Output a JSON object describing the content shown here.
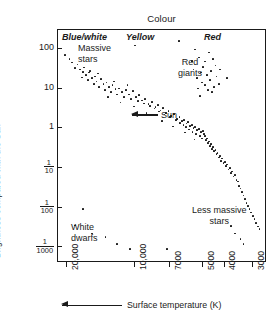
{
  "figure": {
    "top_title": "Colour",
    "y_axis_title": "Brightness compared with the Sun",
    "x_axis_title": "Surface temperature (K)"
  },
  "colour_bands": [
    {
      "name": "blue-white",
      "label": "Blue/white"
    },
    {
      "name": "yellow",
      "label": "Yellow"
    },
    {
      "name": "red",
      "label": "Red"
    }
  ],
  "y_axis": {
    "ticks": [
      {
        "label": "100",
        "fraction": null,
        "value": 100
      },
      {
        "label": "10",
        "fraction": null,
        "value": 10
      },
      {
        "label": "1",
        "fraction": null,
        "value": 1
      },
      {
        "label": "1/10",
        "fraction": {
          "num": "1",
          "den": "10"
        },
        "value": 0.1
      },
      {
        "label": "1/100",
        "fraction": {
          "num": "1",
          "den": "100"
        },
        "value": 0.01
      },
      {
        "label": "1/1000",
        "fraction": {
          "num": "1",
          "den": "1000"
        },
        "value": 0.001
      }
    ]
  },
  "x_axis": {
    "ticks": [
      {
        "label": "20,000",
        "value": 20000
      },
      {
        "label": "10,000",
        "value": 10000
      },
      {
        "label": "7000",
        "value": 7000
      },
      {
        "label": "5000",
        "value": 5000
      },
      {
        "label": "4000",
        "value": 4000
      },
      {
        "label": "3000",
        "value": 3000
      }
    ]
  },
  "annotations": [
    {
      "name": "massive-stars",
      "label": "Massive\nstars"
    },
    {
      "name": "red-giants",
      "label": "Red\ngiants"
    },
    {
      "name": "sun",
      "label": "Sun"
    },
    {
      "name": "white-dwarfs",
      "label": "White\ndwarfs"
    },
    {
      "name": "less-massive-stars",
      "label": "Less massive\nstars"
    }
  ],
  "chart_data": {
    "type": "scatter",
    "title": "Colour",
    "xlabel": "Surface temperature (K)",
    "ylabel": "Brightness compared with the Sun",
    "xlim": [
      22000,
      2600
    ],
    "ylim": [
      0.0004,
      300
    ],
    "x_scale": "log-reversed",
    "y_scale": "log",
    "grid": false,
    "legend": null,
    "xticks": [
      20000,
      10000,
      7000,
      5000,
      4000,
      3000
    ],
    "xticklabels": [
      "20,000",
      "10,000",
      "7000",
      "5000",
      "4000",
      "3000"
    ],
    "yticks": [
      100,
      10,
      1,
      0.1,
      0.01,
      0.001
    ],
    "yticklabels": [
      "100",
      "10",
      "1",
      "1/10",
      "1/100",
      "1/1000"
    ],
    "annotations": [
      {
        "text": "Massive stars",
        "x": 14000,
        "y": 60
      },
      {
        "text": "Red giants",
        "x": 4300,
        "y": 30
      },
      {
        "text": "Sun",
        "x": 4900,
        "y": 1.1
      },
      {
        "text": "White dwarfs",
        "x": 13000,
        "y": 0.0013
      },
      {
        "text": "Less massive stars",
        "x": 3500,
        "y": 0.004
      }
    ],
    "series": [
      {
        "name": "Main sequence (upper)",
        "points": [
          [
            20500,
            70
          ],
          [
            19000,
            45
          ],
          [
            18000,
            40
          ],
          [
            17500,
            30
          ],
          [
            17000,
            26
          ],
          [
            16500,
            22
          ],
          [
            16000,
            25
          ],
          [
            15500,
            18
          ],
          [
            15000,
            20
          ],
          [
            14800,
            15
          ],
          [
            14200,
            17
          ],
          [
            13800,
            13
          ],
          [
            13400,
            14
          ],
          [
            13000,
            11
          ],
          [
            12600,
            12
          ],
          [
            12200,
            9.5
          ],
          [
            11800,
            10
          ],
          [
            11400,
            8
          ],
          [
            11000,
            9
          ],
          [
            10600,
            7
          ],
          [
            10200,
            8.5
          ],
          [
            9900,
            6
          ],
          [
            9600,
            6.8
          ],
          [
            9300,
            5
          ],
          [
            9000,
            5.5
          ],
          [
            8700,
            4
          ],
          [
            8400,
            4.6
          ],
          [
            8100,
            3.4
          ],
          [
            7900,
            3.8
          ],
          [
            7700,
            2.8
          ],
          [
            7500,
            3.2
          ],
          [
            7300,
            2.4
          ],
          [
            7100,
            2.7
          ],
          [
            6900,
            2.0
          ],
          [
            6700,
            2.3
          ],
          [
            6500,
            1.7
          ],
          [
            6350,
            1.9
          ],
          [
            6200,
            1.5
          ],
          [
            6050,
            1.6
          ],
          [
            5900,
            1.3
          ],
          [
            5800,
            1.4
          ],
          [
            5700,
            1.15
          ],
          [
            5600,
            1.2
          ],
          [
            5500,
            1.0
          ],
          [
            5400,
            1.05
          ],
          [
            5300,
            0.9
          ],
          [
            5200,
            0.95
          ],
          [
            5100,
            0.8
          ],
          [
            5000,
            0.85
          ],
          [
            4950,
            0.7
          ]
        ]
      },
      {
        "name": "Main sequence (scatter spread)",
        "points": [
          [
            19500,
            55
          ],
          [
            18500,
            33
          ],
          [
            17200,
            19
          ],
          [
            16200,
            16
          ],
          [
            15200,
            13
          ],
          [
            14400,
            11
          ],
          [
            13600,
            9
          ],
          [
            12800,
            8
          ],
          [
            12000,
            7
          ],
          [
            11200,
            6.2
          ],
          [
            10400,
            5.4
          ],
          [
            9700,
            4.8
          ],
          [
            9100,
            4.2
          ],
          [
            8600,
            3.6
          ],
          [
            8200,
            3.1
          ],
          [
            7800,
            2.6
          ],
          [
            7400,
            2.2
          ],
          [
            7000,
            1.9
          ],
          [
            6600,
            1.6
          ],
          [
            6300,
            1.35
          ],
          [
            6100,
            1.2
          ],
          [
            5950,
            1.05
          ],
          [
            5750,
            0.92
          ],
          [
            5550,
            0.8
          ],
          [
            5350,
            0.72
          ],
          [
            5150,
            0.62
          ],
          [
            5050,
            0.55
          ],
          [
            13200,
            6.0
          ],
          [
            11600,
            4.4
          ],
          [
            10100,
            3.5
          ],
          [
            8900,
            2.4
          ],
          [
            7600,
            1.5
          ],
          [
            6800,
            1.1
          ],
          [
            6000,
            0.78
          ],
          [
            5450,
            0.52
          ],
          [
            16800,
            34
          ],
          [
            15800,
            28
          ],
          [
            14600,
            24
          ],
          [
            12400,
            15
          ],
          [
            10800,
            12
          ]
        ]
      },
      {
        "name": "Main sequence (lower)",
        "points": [
          [
            4900,
            0.62
          ],
          [
            4850,
            0.5
          ],
          [
            4800,
            0.55
          ],
          [
            4750,
            0.42
          ],
          [
            4700,
            0.46
          ],
          [
            4650,
            0.36
          ],
          [
            4600,
            0.4
          ],
          [
            4550,
            0.3
          ],
          [
            4500,
            0.33
          ],
          [
            4450,
            0.26
          ],
          [
            4400,
            0.28
          ],
          [
            4350,
            0.22
          ],
          [
            4300,
            0.24
          ],
          [
            4250,
            0.18
          ],
          [
            4200,
            0.2
          ],
          [
            4150,
            0.15
          ],
          [
            4100,
            0.17
          ],
          [
            4050,
            0.13
          ],
          [
            4000,
            0.14
          ],
          [
            3950,
            0.11
          ],
          [
            3900,
            0.12
          ],
          [
            3850,
            0.09
          ],
          [
            3800,
            0.1
          ],
          [
            3750,
            0.075
          ],
          [
            3700,
            0.08
          ],
          [
            3650,
            0.06
          ],
          [
            3600,
            0.065
          ],
          [
            3550,
            0.05
          ],
          [
            3500,
            0.045
          ],
          [
            3450,
            0.035
          ],
          [
            3400,
            0.03
          ],
          [
            3350,
            0.024
          ],
          [
            3300,
            0.02
          ],
          [
            3250,
            0.016
          ],
          [
            3200,
            0.013
          ],
          [
            3150,
            0.011
          ],
          [
            3100,
            0.009
          ],
          [
            3050,
            0.0075
          ],
          [
            3000,
            0.006
          ],
          [
            2950,
            0.005
          ],
          [
            2900,
            0.004
          ],
          [
            2850,
            0.0033
          ],
          [
            2800,
            0.0028
          ]
        ]
      },
      {
        "name": "Red giants",
        "points": [
          [
            5200,
            60
          ],
          [
            4900,
            48
          ],
          [
            4700,
            80
          ],
          [
            4500,
            55
          ],
          [
            5400,
            95
          ],
          [
            5000,
            35
          ],
          [
            4400,
            38
          ],
          [
            5600,
            50
          ],
          [
            4800,
            22
          ],
          [
            5100,
            25
          ],
          [
            4600,
            28
          ],
          [
            5300,
            18
          ],
          [
            4200,
            30
          ],
          [
            4650,
            16
          ],
          [
            5500,
            30
          ],
          [
            5050,
            14
          ],
          [
            4350,
            20
          ],
          [
            4900,
            12
          ],
          [
            4450,
            11
          ],
          [
            5250,
            10
          ],
          [
            4750,
            9
          ],
          [
            4250,
            13
          ],
          [
            4550,
            8
          ],
          [
            3900,
            18
          ],
          [
            5150,
            6.5
          ]
        ]
      },
      {
        "name": "White dwarfs",
        "points": [
          [
            17000,
            0.009
          ],
          [
            13500,
            0.0018
          ],
          [
            12000,
            0.0012
          ],
          [
            15500,
            0.0022
          ],
          [
            10500,
            0.0009
          ],
          [
            18500,
            0.0035
          ]
        ]
      },
      {
        "name": "Stray points",
        "points": [
          [
            10000,
            120
          ],
          [
            6400,
            160
          ],
          [
            3600,
            0.0022
          ],
          [
            3400,
            0.0016
          ],
          [
            3750,
            0.0034
          ],
          [
            3300,
            0.0012
          ],
          [
            7200,
            0.0009
          ]
        ]
      }
    ]
  }
}
